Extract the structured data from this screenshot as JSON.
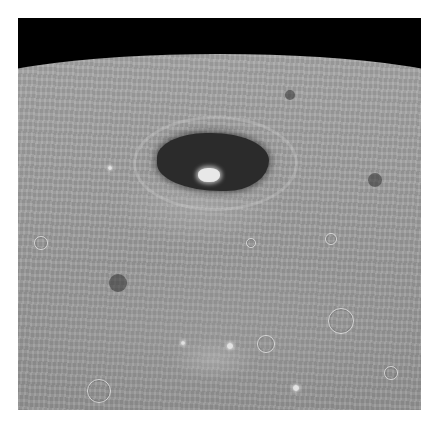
{
  "image": {
    "subject": "Lunar surface with dark-floored crater viewed obliquely from orbit",
    "colors": {
      "sky": "#000000",
      "surface": "#8e8e8e",
      "crater_floor": "#2b2b2b",
      "central_peak": "#e8e8e8",
      "border": "#ffffff"
    },
    "features": {
      "dark_crater": {
        "x": 157,
        "y": 133,
        "w": 112,
        "h": 58
      },
      "central_peak": {
        "x": 198,
        "y": 168
      },
      "small_craters": [
        {
          "x": 340,
          "y": 320,
          "r": 12
        },
        {
          "x": 98,
          "y": 390,
          "r": 11
        },
        {
          "x": 265,
          "y": 343,
          "r": 8
        },
        {
          "x": 40,
          "y": 242,
          "r": 6
        },
        {
          "x": 330,
          "y": 238,
          "r": 5
        },
        {
          "x": 390,
          "y": 372,
          "r": 6
        },
        {
          "x": 250,
          "y": 242,
          "r": 4
        }
      ],
      "bright_spots": [
        {
          "x": 230,
          "y": 346,
          "r": 3
        },
        {
          "x": 183,
          "y": 343,
          "r": 2
        },
        {
          "x": 296,
          "y": 388,
          "r": 3
        },
        {
          "x": 110,
          "y": 168,
          "r": 2
        }
      ],
      "dark_spots": [
        {
          "x": 375,
          "y": 180,
          "r": 7
        },
        {
          "x": 290,
          "y": 95,
          "r": 5
        },
        {
          "x": 118,
          "y": 283,
          "r": 9
        }
      ]
    }
  }
}
